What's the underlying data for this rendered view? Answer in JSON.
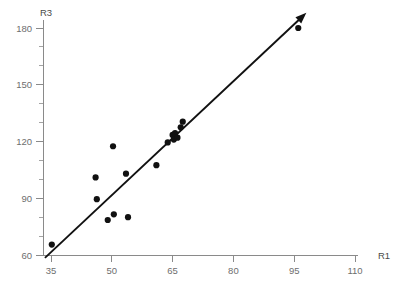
{
  "chart_data": {
    "type": "scatter",
    "title": "",
    "xlabel": "R1",
    "ylabel": "R3",
    "xlim": [
      32,
      112
    ],
    "ylim": [
      57,
      184
    ],
    "grid": false,
    "legend": null,
    "x_ticks": [
      35,
      50,
      65,
      80,
      95,
      110
    ],
    "x_tick_labels": [
      "35",
      "50",
      "65",
      "80",
      "95",
      "110"
    ],
    "y_ticks": [
      60,
      90,
      120,
      150,
      180
    ],
    "y_tick_labels": [
      "60",
      "90",
      "120",
      "150",
      "180"
    ],
    "y_minor_ticks": [
      70,
      80,
      100,
      110,
      130,
      140,
      160,
      170
    ],
    "series": [
      {
        "name": "observations",
        "marker": "filled-circle",
        "color": "#111111",
        "points": [
          {
            "x": 35.2,
            "y": 65.5
          },
          {
            "x": 46.3,
            "y": 89.5
          },
          {
            "x": 46.0,
            "y": 101.0
          },
          {
            "x": 49.0,
            "y": 78.5
          },
          {
            "x": 50.3,
            "y": 117.5
          },
          {
            "x": 50.5,
            "y": 81.5
          },
          {
            "x": 54.0,
            "y": 80.0
          },
          {
            "x": 53.5,
            "y": 103.0
          },
          {
            "x": 61.0,
            "y": 107.5
          },
          {
            "x": 63.8,
            "y": 119.5
          },
          {
            "x": 65.0,
            "y": 123.5
          },
          {
            "x": 65.3,
            "y": 121.0
          },
          {
            "x": 65.6,
            "y": 124.5
          },
          {
            "x": 66.2,
            "y": 122.0
          },
          {
            "x": 67.0,
            "y": 127.5
          },
          {
            "x": 67.5,
            "y": 130.5
          },
          {
            "x": 96.0,
            "y": 180.0
          }
        ]
      }
    ],
    "trend_line": {
      "name": "regression-line",
      "color": "#111111",
      "has_arrowhead": true,
      "arrow_end": "upper-right",
      "x_start": 33.5,
      "y_start": 58.5,
      "x_end": 98.0,
      "y_end": 188.0
    }
  },
  "axes": {
    "x_axis_name": "R1",
    "y_axis_name": "R3"
  }
}
